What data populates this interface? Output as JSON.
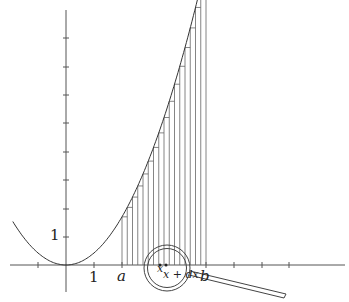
{
  "figure": {
    "labels": {
      "y_one": "1",
      "x_one": "1",
      "a": "a",
      "b": "b",
      "x": "x",
      "x_plus_dx": "x + dx"
    },
    "colors": {
      "curve": "#333333",
      "axes": "#555555",
      "strips": "#666666"
    },
    "strip_count": 16
  }
}
